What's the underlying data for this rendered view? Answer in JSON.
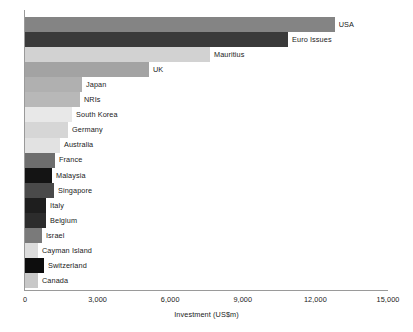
{
  "chart_data": {
    "type": "bar",
    "orientation": "horizontal",
    "title": "",
    "xlabel": "Investment (US$m)",
    "ylabel": "",
    "xlim": [
      0,
      15000
    ],
    "xticks": [
      0,
      3000,
      6000,
      9000,
      12000,
      15000
    ],
    "xticklabels": [
      "0",
      "3,000",
      "6,000",
      "9,000",
      "12,000",
      "15,000"
    ],
    "grid": false,
    "legend": false,
    "categories": [
      "USA",
      "Euro Issues",
      "Mauritius",
      "UK",
      "Japan",
      "NRIs",
      "South Korea",
      "Germany",
      "Australia",
      "France",
      "Malaysia",
      "Singapore",
      "Italy",
      "Belgium",
      "Israel",
      "Cayman Island",
      "Switzerland",
      "Canada"
    ],
    "values": [
      12800,
      10870,
      7645,
      5124,
      2355,
      2273,
      1942,
      1777,
      1446,
      1240,
      1116,
      1198,
      868,
      868,
      702,
      537,
      785,
      537
    ],
    "bar_colors": [
      "#848484",
      "#3a3a3a",
      "#d2d2d2",
      "#a3a3a3",
      "#b0b0b0",
      "#b8b8b8",
      "#e8e8e8",
      "#d6d6d6",
      "#e2e2e2",
      "#6e6e6e",
      "#141414",
      "#4a4a4a",
      "#1e1e1e",
      "#2c2c2c",
      "#7a7a7a",
      "#dcdcdc",
      "#0d0d0d",
      "#c8c8c8"
    ],
    "axis_color": "#9a9a9a",
    "text_color": "#1a1a1a",
    "background": "#ffffff"
  }
}
